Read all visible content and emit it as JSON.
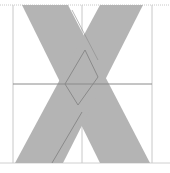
{
  "diagram": {
    "type": "glyph-construction",
    "glyph": "X",
    "colors": {
      "background": "#ffffff",
      "stroke_fill": "#b4b4b4",
      "guide_line": "#c8c8c8",
      "construction_line": "#8a8a8a",
      "baseline": "#d0d0d0"
    },
    "guides": {
      "cap_height_y": 5,
      "baseline_y": 163,
      "mid_y": 84,
      "left_x": 13,
      "center_x": 82,
      "right_x": 152
    },
    "strokes": [
      {
        "name": "descending-stroke",
        "points": "22,5 68,5 150,163 100,163"
      },
      {
        "name": "ascending-stroke",
        "points": "100,5 143,5 63,163 15,163"
      }
    ],
    "construction": {
      "diamond": "85,50 98,77 78,105 65,84",
      "diagonal": {
        "x1": 82,
        "y1": 112,
        "x2": 52,
        "y2": 163
      },
      "center_spine": {
        "x1": 72,
        "y1": 10,
        "x2": 98,
        "y2": 60
      }
    }
  }
}
